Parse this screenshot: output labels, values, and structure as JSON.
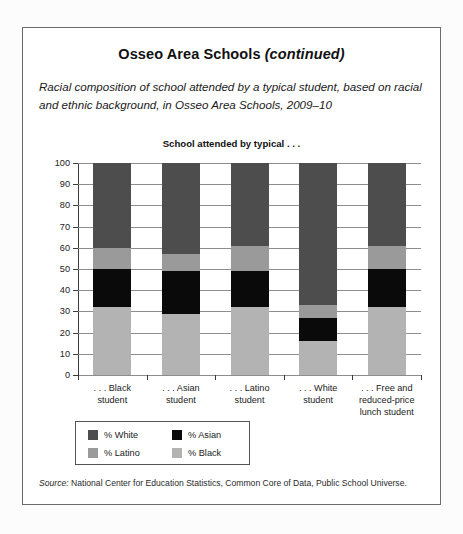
{
  "card": {
    "title_main": "Osseo Area Schools ",
    "title_continued": "(continued)",
    "subtitle": "Racial composition of school attended by a typical student, based on racial and ethnic background, in Osseo Area Schools, 2009–10",
    "source_label": "Source:",
    "source_text": " National Center for Education Statistics, Common Core of Data, Public School Universe."
  },
  "chart_data": {
    "type": "bar",
    "subtype": "stacked-bar-100",
    "title": "School attended by typical . . .",
    "xlabel": "",
    "ylabel": "",
    "ylim": [
      0,
      100
    ],
    "ytick_step": 10,
    "grid": true,
    "legend_position": "below-plot-left",
    "categories": [
      ". . . Black\nstudent",
      ". . . Asian\nstudent",
      ". . . Latino\nstudent",
      ". . . White\nstudent",
      ". . . Free and\nreduced-price\nlunch student"
    ],
    "category_labels": [
      {
        "line1": ". . . Black",
        "line2": "student",
        "line3": ""
      },
      {
        "line1": ". . . Asian",
        "line2": "student",
        "line3": ""
      },
      {
        "line1": ". . . Latino",
        "line2": "student",
        "line3": ""
      },
      {
        "line1": ". . . White",
        "line2": "student",
        "line3": ""
      },
      {
        "line1": ". . . Free and",
        "line2": "reduced-price",
        "line3": "lunch student"
      }
    ],
    "ytick_labels": [
      "100",
      "90",
      "80",
      "70",
      "60",
      "50",
      "40",
      "30",
      "20",
      "10",
      "0"
    ],
    "ytick_values": [
      100,
      90,
      80,
      70,
      60,
      50,
      40,
      30,
      20,
      10,
      0
    ],
    "series": [
      {
        "name": "% Black",
        "color": "#b3b3b3",
        "values": [
          32,
          29,
          32,
          16,
          32
        ]
      },
      {
        "name": "% Asian",
        "color": "#0a0a0a",
        "values": [
          18,
          20,
          17,
          11,
          18
        ]
      },
      {
        "name": "% Latino",
        "color": "#9a9a9a",
        "values": [
          10,
          8,
          12,
          6,
          11
        ]
      },
      {
        "name": "% White",
        "color": "#4d4d4d",
        "values": [
          40,
          43,
          39,
          67,
          39
        ]
      }
    ],
    "stack_order_bottom_to_top": [
      "% Black",
      "% Asian",
      "% Latino",
      "% White"
    ],
    "cumulative_tops": {
      ". . . Black student": {
        "black": 32,
        "asian": 50,
        "latino": 60,
        "white": 100
      },
      ". . . Asian student": {
        "black": 29,
        "asian": 49,
        "latino": 57,
        "white": 100
      },
      ". . . Latino student": {
        "black": 32,
        "asian": 49,
        "latino": 61,
        "white": 100
      },
      ". . . White student": {
        "black": 16,
        "asian": 27,
        "latino": 33,
        "white": 100
      },
      ". . . Free and reduced-price lunch student": {
        "black": 32,
        "asian": 50,
        "latino": 61,
        "white": 100
      }
    },
    "legend": [
      {
        "label": "% White",
        "color": "#4d4d4d"
      },
      {
        "label": "% Asian",
        "color": "#0a0a0a"
      },
      {
        "label": "% Latino",
        "color": "#9a9a9a"
      },
      {
        "label": "% Black",
        "color": "#b3b3b3"
      }
    ]
  }
}
